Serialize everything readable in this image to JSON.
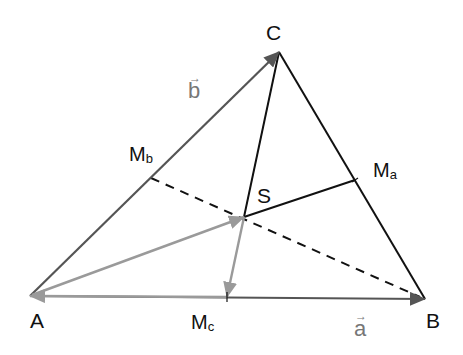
{
  "figure": {
    "vertices": {
      "A": {
        "label": "A",
        "x": 30,
        "y": 296
      },
      "B": {
        "label": "B",
        "x": 425,
        "y": 299
      },
      "C": {
        "label": "C",
        "x": 279,
        "y": 52
      }
    },
    "midpoints": {
      "Ma": {
        "label": "M",
        "sub": "a",
        "x": 355,
        "y": 180
      },
      "Mb": {
        "label": "M",
        "sub": "b",
        "x": 151,
        "y": 178
      },
      "Mc": {
        "label": "M",
        "sub": "c",
        "x": 227,
        "y": 297
      }
    },
    "centroid": {
      "label": "S",
      "x": 244,
      "y": 217
    },
    "vectors": {
      "a": {
        "label": "a",
        "arrow": "→",
        "from": "A",
        "to": "B"
      },
      "b": {
        "label": "b",
        "arrow": "→",
        "from": "A",
        "to": "C"
      }
    },
    "colors": {
      "side_vector": "#555555",
      "side": "#111111",
      "median": "#111111",
      "gray_vector": "#9a9a9a",
      "vector_label": "#777777"
    }
  }
}
